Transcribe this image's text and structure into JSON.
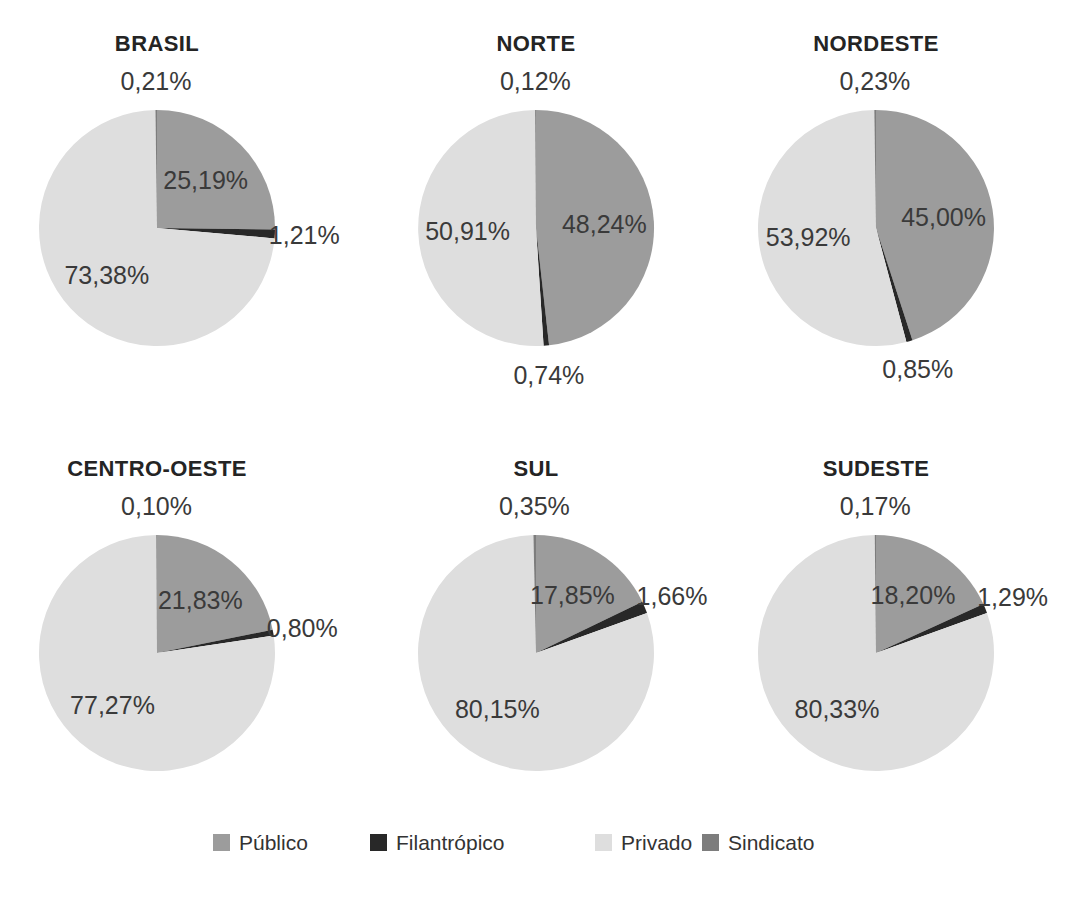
{
  "chart_data": {
    "type": "pie",
    "layout": "small multiples, 2 rows x 3 columns, shared legend at bottom",
    "slice_order": "clockwise from 12 o'clock, series order",
    "series_names": [
      "Público",
      "Filantrópico",
      "Privado",
      "Sindicato"
    ],
    "series_colors": [
      "#9c9c9c",
      "#282828",
      "#dedede",
      "#7d7d7d"
    ],
    "label_format": "percent with comma decimal separator",
    "charts": [
      {
        "title": "BRASIL",
        "values": [
          25.19,
          1.21,
          73.38,
          0.21
        ],
        "labels": [
          "25,19%",
          "1,21%",
          "73,38%",
          "0,21%"
        ]
      },
      {
        "title": "NORTE",
        "values": [
          48.24,
          0.74,
          50.91,
          0.12
        ],
        "labels": [
          "48,24%",
          "0,74%",
          "50,91%",
          "0,12%"
        ]
      },
      {
        "title": "NORDESTE",
        "values": [
          45.0,
          0.85,
          53.92,
          0.23
        ],
        "labels": [
          "45,00%",
          "0,85%",
          "53,92%",
          "0,23%"
        ]
      },
      {
        "title": "CENTRO-OESTE",
        "values": [
          21.83,
          0.8,
          77.27,
          0.1
        ],
        "labels": [
          "21,83%",
          "0,80%",
          "77,27%",
          "0,10%"
        ]
      },
      {
        "title": "SUL",
        "values": [
          17.85,
          1.66,
          80.15,
          0.35
        ],
        "labels": [
          "17,85%",
          "1,66%",
          "80,15%",
          "0,35%"
        ]
      },
      {
        "title": "SUDESTE",
        "values": [
          18.2,
          1.29,
          80.33,
          0.17
        ],
        "labels": [
          "18,20%",
          "1,29%",
          "80,33%",
          "0,17%"
        ]
      }
    ],
    "legend": {
      "position": "bottom",
      "items": [
        {
          "label": "Público",
          "color": "#9c9c9c"
        },
        {
          "label": "Filantrópico",
          "color": "#282828"
        },
        {
          "label": "Privado",
          "color": "#dedede"
        },
        {
          "label": "Sindicato",
          "color": "#7d7d7d"
        }
      ]
    }
  }
}
